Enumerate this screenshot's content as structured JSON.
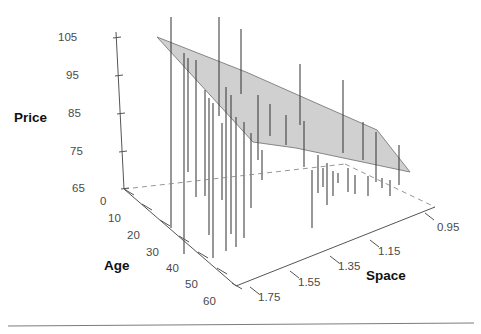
{
  "figure": {
    "kind": "3d-scatter-with-regression-plane",
    "background_color": "#ffffff",
    "plane_color": "#c9c9c9",
    "stem_color": "#3a3a3a",
    "axis_color": "#555555",
    "width": 481,
    "height": 334
  },
  "axes": {
    "price": {
      "title": "Price",
      "title_pos": {
        "x": 14,
        "y": 122
      },
      "ticks": [
        {
          "label": "105",
          "lx": 58,
          "ly": 41,
          "tx1": 113,
          "ty1": 38,
          "tx2": 121,
          "ty2": 37
        },
        {
          "label": "95",
          "lx": 66,
          "ly": 79,
          "tx1": 115,
          "ty1": 76,
          "tx2": 123,
          "ty2": 75
        },
        {
          "label": "85",
          "lx": 68,
          "ly": 117,
          "tx1": 117,
          "ty1": 114,
          "tx2": 125,
          "ty2": 113
        },
        {
          "label": "75",
          "lx": 70,
          "ly": 155,
          "tx1": 119,
          "ty1": 152,
          "tx2": 127,
          "ty2": 151
        },
        {
          "label": "65",
          "lx": 72,
          "ly": 192,
          "tx1": 121,
          "ty1": 189,
          "tx2": 129,
          "ty2": 188
        }
      ],
      "line": "M116,32 L124,189"
    },
    "age": {
      "title": "Age",
      "title_pos": {
        "x": 104,
        "y": 270
      },
      "line": "M124,189 L236,286",
      "ticks": [
        {
          "label": "0",
          "lx": 100,
          "ly": 205,
          "tx1": 124,
          "ty1": 189,
          "tx2": 134,
          "ty2": 195
        },
        {
          "label": "10",
          "lx": 108,
          "ly": 222,
          "tx1": 142,
          "ty1": 204,
          "tx2": 152,
          "ty2": 210
        },
        {
          "label": "20",
          "lx": 127,
          "ly": 239,
          "tx1": 160,
          "ty1": 220,
          "tx2": 170,
          "ty2": 226
        },
        {
          "label": "30",
          "lx": 146,
          "ly": 256,
          "tx1": 179,
          "ty1": 236,
          "tx2": 189,
          "ty2": 242
        },
        {
          "label": "40",
          "lx": 166,
          "ly": 272,
          "tx1": 198,
          "ty1": 252,
          "tx2": 208,
          "ty2": 258
        },
        {
          "label": "50",
          "lx": 185,
          "ly": 288,
          "tx1": 217,
          "ty1": 268,
          "tx2": 227,
          "ty2": 274
        },
        {
          "label": "60",
          "lx": 203,
          "ly": 305,
          "tx1": 232,
          "ty1": 283,
          "tx2": 242,
          "ty2": 289
        }
      ]
    },
    "space": {
      "title": "Space",
      "title_pos": {
        "x": 366,
        "y": 280
      },
      "line": "M236,286 L435,207",
      "ticks": [
        {
          "label": "1.75",
          "lx": 258,
          "ly": 301,
          "tx1": 250,
          "ty1": 287,
          "tx2": 259,
          "ty2": 294
        },
        {
          "label": "1.55",
          "lx": 298,
          "ly": 286,
          "tx1": 290,
          "ty1": 271,
          "tx2": 299,
          "ty2": 278
        },
        {
          "label": "1.35",
          "lx": 338,
          "ly": 270,
          "tx1": 330,
          "ty1": 256,
          "tx2": 339,
          "ty2": 263
        },
        {
          "label": "1.15",
          "lx": 378,
          "ly": 255,
          "tx1": 370,
          "ty1": 240,
          "tx2": 379,
          "ty2": 247
        },
        {
          "label": "0.95",
          "lx": 437,
          "ly": 231,
          "tx1": 425,
          "ty1": 213,
          "tx2": 434,
          "ty2": 220
        }
      ]
    },
    "back_edges": [
      "M124,189 L345,164",
      "M345,164 L435,207"
    ]
  },
  "plane": {
    "points": "157,37 253,142 296,148 410,172 377,130 246,72",
    "outline": "157,37 253,142 410,172 157,37"
  },
  "stems": [
    {
      "x": 171,
      "y1": 17,
      "y2": 228
    },
    {
      "x": 184,
      "y1": 53,
      "y2": 254
    },
    {
      "x": 188,
      "y1": 58,
      "y2": 172
    },
    {
      "x": 196,
      "y1": 60,
      "y2": 197
    },
    {
      "x": 205,
      "y1": 90,
      "y2": 196
    },
    {
      "x": 209,
      "y1": 98,
      "y2": 235
    },
    {
      "x": 213,
      "y1": 103,
      "y2": 258
    },
    {
      "x": 219,
      "y1": 17,
      "y2": 116
    },
    {
      "x": 222,
      "y1": 123,
      "y2": 200
    },
    {
      "x": 226,
      "y1": 87,
      "y2": 251
    },
    {
      "x": 231,
      "y1": 95,
      "y2": 234
    },
    {
      "x": 236,
      "y1": 117,
      "y2": 247
    },
    {
      "x": 241,
      "y1": 29,
      "y2": 94
    },
    {
      "x": 244,
      "y1": 122,
      "y2": 238
    },
    {
      "x": 251,
      "y1": 133,
      "y2": 208
    },
    {
      "x": 258,
      "y1": 95,
      "y2": 160
    },
    {
      "x": 262,
      "y1": 150,
      "y2": 180
    },
    {
      "x": 270,
      "y1": 104,
      "y2": 136
    },
    {
      "x": 286,
      "y1": 115,
      "y2": 145
    },
    {
      "x": 300,
      "y1": 64,
      "y2": 125
    },
    {
      "x": 304,
      "y1": 121,
      "y2": 167
    },
    {
      "x": 312,
      "y1": 170,
      "y2": 228
    },
    {
      "x": 318,
      "y1": 155,
      "y2": 193
    },
    {
      "x": 323,
      "y1": 168,
      "y2": 187
    },
    {
      "x": 327,
      "y1": 163,
      "y2": 205
    },
    {
      "x": 333,
      "y1": 171,
      "y2": 196
    },
    {
      "x": 338,
      "y1": 173,
      "y2": 183
    },
    {
      "x": 343,
      "y1": 80,
      "y2": 153
    },
    {
      "x": 348,
      "y1": 168,
      "y2": 192
    },
    {
      "x": 355,
      "y1": 175,
      "y2": 194
    },
    {
      "x": 363,
      "y1": 122,
      "y2": 160
    },
    {
      "x": 368,
      "y1": 176,
      "y2": 196
    },
    {
      "x": 376,
      "y1": 132,
      "y2": 182
    },
    {
      "x": 382,
      "y1": 178,
      "y2": 188
    },
    {
      "x": 390,
      "y1": 180,
      "y2": 196
    },
    {
      "x": 399,
      "y1": 145,
      "y2": 185
    }
  ],
  "footer_rule": {
    "x1": 8,
    "y1": 326,
    "x2": 474,
    "y2": 323
  }
}
